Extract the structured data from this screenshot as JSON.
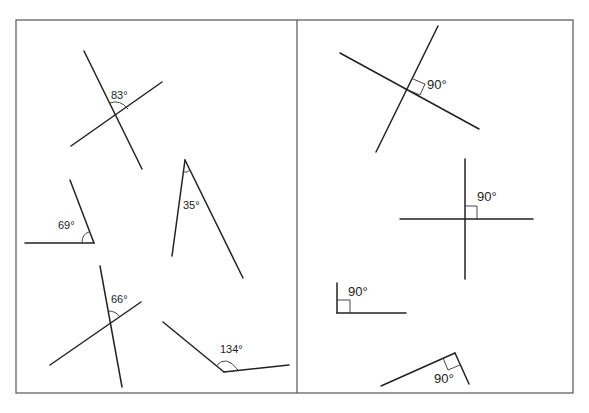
{
  "frame": {
    "left": 16,
    "top": 20,
    "right": 573,
    "bottom": 393,
    "divider_x": 297
  },
  "panels": [
    {
      "name": "left-panel",
      "description": "Non-right angles",
      "angles": [
        {
          "id": "angle-83",
          "label": "83°",
          "value": 83,
          "type": "intersecting-lines"
        },
        {
          "id": "angle-69",
          "label": "69°",
          "value": 69,
          "type": "single-angle"
        },
        {
          "id": "angle-35",
          "label": "35°",
          "value": 35,
          "type": "single-angle"
        },
        {
          "id": "angle-66",
          "label": "66°",
          "value": 66,
          "type": "intersecting-lines"
        },
        {
          "id": "angle-134",
          "label": "134°",
          "value": 134,
          "type": "single-angle"
        }
      ]
    },
    {
      "name": "right-panel",
      "description": "Right angles",
      "angles": [
        {
          "id": "angle-90-a",
          "label": "90°",
          "value": 90,
          "type": "intersecting-lines"
        },
        {
          "id": "angle-90-b",
          "label": "90°",
          "value": 90,
          "type": "intersecting-lines"
        },
        {
          "id": "angle-90-c",
          "label": "90°",
          "value": 90,
          "type": "single-angle"
        },
        {
          "id": "angle-90-d",
          "label": "90°",
          "value": 90,
          "type": "single-angle"
        }
      ]
    }
  ],
  "labels": {
    "a83": "83°",
    "a69": "69°",
    "a35": "35°",
    "a66": "66°",
    "a134": "134°",
    "r1": "90°",
    "r2": "90°",
    "r3": "90°",
    "r4": "90°"
  }
}
